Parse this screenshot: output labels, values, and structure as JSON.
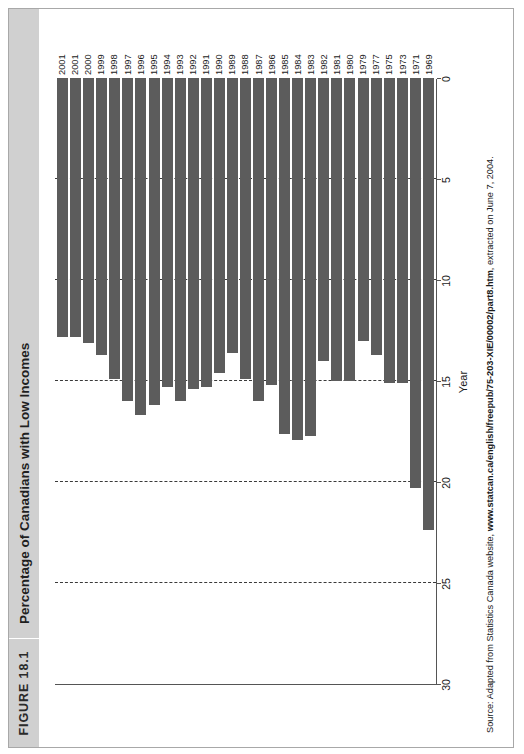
{
  "figure": {
    "number_label": "FIGURE 18.1",
    "title": "Percentage of Canadians with Low Incomes",
    "source_prefix": "Source: Adapted from Statistics Canada website, ",
    "source_url": "www.statcan.ca/english/freepub/75-203-XIE/00002/part8.htm",
    "source_suffix": ", extracted on June 7, 2004.",
    "bar_color": "#5c5c5c",
    "header_color": "#d0d0d0"
  },
  "chart_data": {
    "type": "bar",
    "title": "Percentage of Canadians with Low Incomes",
    "orientation": "horizontal",
    "xlabel": "Year",
    "ylabel": "",
    "ylim": [
      0,
      30
    ],
    "yticks": [
      0,
      5,
      10,
      15,
      20,
      25,
      30
    ],
    "grid": true,
    "legend": "none",
    "categories": [
      "1969",
      "1971",
      "1973",
      "1975",
      "1977",
      "1979",
      "1980",
      "1981",
      "1982",
      "1983",
      "1984",
      "1985",
      "1986",
      "1987",
      "1988",
      "1989",
      "1990",
      "1991",
      "1992",
      "1993",
      "1994",
      "1995",
      "1996",
      "1997",
      "1998",
      "1999",
      "2000",
      "2001",
      "2001"
    ],
    "values": [
      22.4,
      20.3,
      15.1,
      15.1,
      13.7,
      13.0,
      15.0,
      15.0,
      14.0,
      17.7,
      17.9,
      17.6,
      15.2,
      16.0,
      14.9,
      13.6,
      14.6,
      15.3,
      15.4,
      16.0,
      15.3,
      16.2,
      16.7,
      16.0,
      14.9,
      13.7,
      13.1,
      12.8,
      12.8
    ]
  }
}
